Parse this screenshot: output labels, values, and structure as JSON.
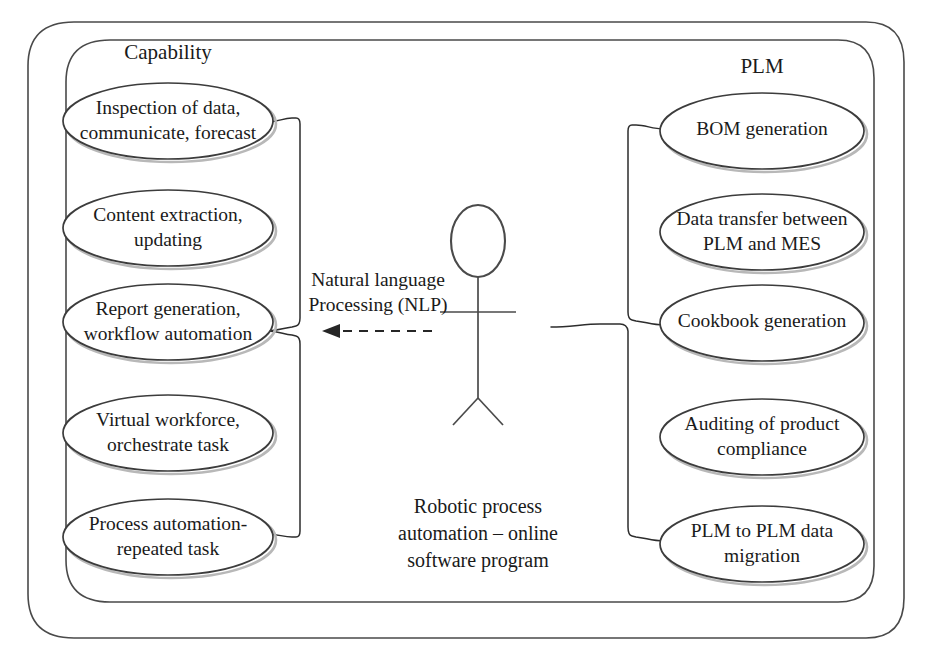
{
  "diagram": {
    "type": "uml-use-case-diagram",
    "title_visible": false,
    "background_color": "#ffffff",
    "line_color": "#3c3c3c",
    "text_color": "#1a1a1a"
  },
  "groups": {
    "left": {
      "label": "Capability",
      "label_x": 168,
      "label_y": 54
    },
    "right": {
      "label": "PLM",
      "label_x": 762,
      "label_y": 68
    }
  },
  "actor": {
    "name": "stick-figure-actor",
    "center_x": 478,
    "head_top_y": 205,
    "head_bottom_y": 278,
    "arms_y": 312,
    "hip_y": 398,
    "feet_y": 425
  },
  "edge_label": {
    "line1": "Natural language",
    "line2": "Processing (NLP)",
    "x": 378,
    "y1": 282,
    "y2": 307
  },
  "caption": {
    "line1": "Robotic process",
    "line2": "automation – online",
    "line3": "software program",
    "x": 478,
    "y1": 508,
    "y2": 535,
    "y3": 562
  },
  "use_cases_left": [
    {
      "id": "inspection-of-data",
      "lines": [
        "Inspection of data,",
        "communicate, forecast"
      ],
      "cx": 168,
      "cy": 121,
      "rx": 105,
      "ry": 38
    },
    {
      "id": "content-extraction",
      "lines": [
        "Content extraction,",
        "updating"
      ],
      "cx": 168,
      "cy": 228,
      "rx": 105,
      "ry": 38
    },
    {
      "id": "report-generation",
      "lines": [
        "Report generation,",
        "workflow automation"
      ],
      "cx": 168,
      "cy": 322,
      "rx": 105,
      "ry": 38
    },
    {
      "id": "virtual-workforce",
      "lines": [
        "Virtual workforce,",
        "orchestrate task"
      ],
      "cx": 168,
      "cy": 433,
      "rx": 105,
      "ry": 38
    },
    {
      "id": "process-automation",
      "lines": [
        "Process automation-",
        "repeated task"
      ],
      "cx": 168,
      "cy": 537,
      "rx": 105,
      "ry": 38
    }
  ],
  "use_cases_right": [
    {
      "id": "bom-generation",
      "lines": [
        "BOM generation"
      ],
      "cx": 762,
      "cy": 131,
      "rx": 102,
      "ry": 38
    },
    {
      "id": "data-transfer-plm-mes",
      "lines": [
        "Data transfer between",
        "PLM and MES"
      ],
      "cx": 762,
      "cy": 232,
      "rx": 102,
      "ry": 38
    },
    {
      "id": "cookbook-generation",
      "lines": [
        "Cookbook generation"
      ],
      "cx": 762,
      "cy": 323,
      "rx": 102,
      "ry": 38
    },
    {
      "id": "auditing-product-compliance",
      "lines": [
        "Auditing of product",
        "compliance"
      ],
      "cx": 762,
      "cy": 437,
      "rx": 102,
      "ry": 38
    },
    {
      "id": "plm-to-plm-migration",
      "lines": [
        "PLM to PLM data",
        "migration"
      ],
      "cx": 762,
      "cy": 544,
      "rx": 102,
      "ry": 38
    }
  ],
  "relationship": {
    "name": "nlp-dependency",
    "style": "dashed",
    "direction": "left",
    "arrow_tip_x": 322,
    "arrow_tail_x": 432,
    "y": 331
  }
}
